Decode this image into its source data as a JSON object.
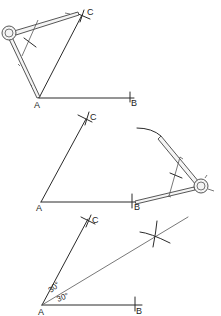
{
  "diagram": {
    "panels": [
      {
        "id": "panel-1",
        "step": "Draw arc from A to locate point C",
        "points": {
          "A": {
            "label": "A",
            "x": 39,
            "y": 98
          },
          "B": {
            "label": "B",
            "x": 130,
            "y": 98
          },
          "C": {
            "label": "C",
            "x": 82,
            "y": 15
          }
        },
        "tool": "compass"
      },
      {
        "id": "panel-2",
        "step": "From B swing arc with compass",
        "points": {
          "A": {
            "label": "A",
            "x": 41,
            "y": 201
          },
          "B": {
            "label": "B",
            "x": 132,
            "y": 201
          },
          "C": {
            "label": "C",
            "x": 86,
            "y": 120
          }
        },
        "tool": "compass"
      },
      {
        "id": "panel-3",
        "step": "Bisect angle CAB into two 30 degree angles",
        "points": {
          "A": {
            "label": "A",
            "x": 42,
            "y": 305
          },
          "B": {
            "label": "B",
            "x": 135,
            "y": 305
          },
          "C": {
            "label": "C",
            "x": 87,
            "y": 221
          }
        },
        "angles": [
          {
            "label": "30°",
            "position": "upper"
          },
          {
            "label": "30°",
            "position": "lower"
          }
        ]
      }
    ],
    "labels": {
      "A": "A",
      "B": "B",
      "C": "C",
      "angle_upper": "30°",
      "angle_lower": "30°"
    },
    "colors": {
      "line": "#2a2a2a",
      "background": "#ffffff"
    }
  }
}
